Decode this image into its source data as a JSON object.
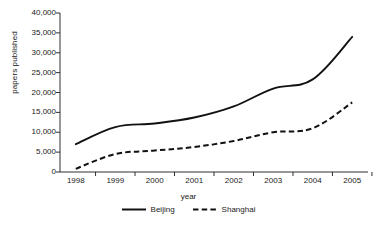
{
  "chart_data": {
    "type": "line",
    "title": "",
    "subtitle": "",
    "xlabel": "year",
    "ylabel": "papers published",
    "categories": [
      "1998",
      "1999",
      "2000",
      "2001",
      "2002",
      "2003",
      "2004",
      "2005"
    ],
    "x": [
      1998,
      1999,
      2000,
      2001,
      2002,
      2003,
      2004,
      2005
    ],
    "xlim": [
      1997.6,
      2005.4
    ],
    "ylim": [
      0,
      40000
    ],
    "grid": false,
    "legend_position": "bottom-center",
    "y_ticks": [
      0,
      5000,
      10000,
      15000,
      20000,
      25000,
      30000,
      35000,
      40000
    ],
    "y_tick_labels": [
      "0",
      "5,000",
      "10,000",
      "15,000",
      "20,000",
      "25,000",
      "30,000",
      "35,000",
      "40,000"
    ],
    "x_tick_labels": [
      "1998",
      "1999",
      "2000",
      "2001",
      "2002",
      "2003",
      "2004",
      "2005"
    ],
    "series": [
      {
        "name": "Beijing",
        "style": "solid",
        "color": "#111111",
        "values": [
          7000,
          11300,
          12200,
          13700,
          16500,
          21000,
          23300,
          34000
        ]
      },
      {
        "name": "Shanghai",
        "style": "dashed",
        "color": "#111111",
        "values": [
          800,
          4500,
          5400,
          6300,
          7800,
          10000,
          11000,
          17500
        ]
      }
    ]
  },
  "legend": {
    "items": [
      {
        "label": "Beijing",
        "swatch": "solid-line-swatch"
      },
      {
        "label": "Shanghai",
        "swatch": "dashed-line-swatch"
      }
    ]
  }
}
